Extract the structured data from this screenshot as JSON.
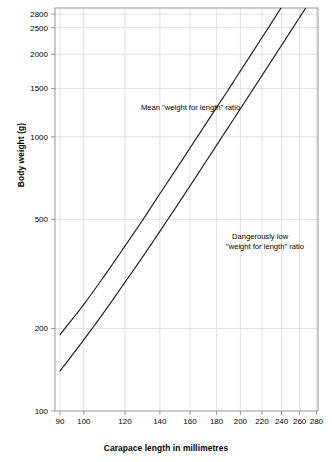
{
  "chart_data": {
    "type": "line",
    "title": "",
    "xlabel": "Carapace length in millimetres",
    "ylabel": "Body weight (g)",
    "xscale": "log",
    "yscale": "log",
    "xlim": [
      88,
      282
    ],
    "ylim": [
      100,
      2950
    ],
    "grid": true,
    "legend_position": "inline-annotations",
    "xticks": [
      90,
      100,
      120,
      140,
      160,
      180,
      200,
      220,
      240,
      260,
      280
    ],
    "xtick_labels": [
      "90",
      "100",
      "120",
      "140",
      "160",
      "180",
      "200",
      "220",
      "240",
      "260",
      "280"
    ],
    "yticks": [
      100,
      200,
      500,
      1000,
      1500,
      2000,
      2500,
      2800
    ],
    "ytick_labels": [
      "100",
      "200",
      "500",
      "1000",
      "1500",
      "2000",
      "2500",
      "2800"
    ],
    "series": [
      {
        "name": "Mean \"weight for length\" ratio",
        "annotation": "Mean \"weight for length\" ratio",
        "color": "#1a1a1a",
        "x": [
          90,
          100,
          110,
          120,
          130,
          140,
          150,
          160,
          170,
          180,
          190,
          200,
          210,
          220,
          230,
          240,
          250,
          260,
          270
        ],
        "y": [
          190,
          245,
          315,
          400,
          500,
          620,
          755,
          910,
          1085,
          1280,
          1495,
          1740,
          2005,
          2300,
          2620,
          2975,
          3360,
          3785,
          4240
        ]
      },
      {
        "name": "Dangerously low \"weight for length\" ratio",
        "annotation_line1": "Dangerously low",
        "annotation_line2": "\"weight for length\" ratio",
        "color": "#1a1a1a",
        "x": [
          90,
          100,
          110,
          120,
          130,
          140,
          150,
          160,
          170,
          180,
          190,
          200,
          210,
          220,
          230,
          240,
          250,
          260,
          270,
          280
        ],
        "y": [
          140,
          182,
          233,
          295,
          367,
          452,
          550,
          662,
          789,
          932,
          1090,
          1266,
          1460,
          1672,
          1905,
          2157,
          2432,
          2728,
          3048,
          3390
        ]
      }
    ],
    "annotations": [
      {
        "name": "mean-ratio-annotation",
        "text": "Mean \"weight for length\" ratio",
        "x_px": 141,
        "y_px": 110
      },
      {
        "name": "low-ratio-annotation-line1",
        "text": "Dangerously low",
        "x_px": 232,
        "y_px": 239
      },
      {
        "name": "low-ratio-annotation-line2",
        "text": "\"weight for length\" ratio",
        "x_px": 226,
        "y_px": 249
      }
    ],
    "colors": {
      "curve": "#1a1a1a",
      "grid": "#d9d9d9",
      "axis": "#8c8c8c",
      "text": "#000000",
      "background": "#ffffff"
    }
  }
}
